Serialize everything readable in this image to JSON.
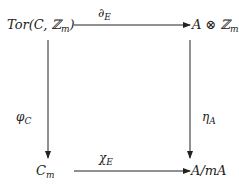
{
  "diagram": {
    "type": "commutative-square",
    "nodes": {
      "top_left": {
        "main": "Tor(C, ℤ",
        "sub": "m",
        "tail": ")"
      },
      "top_right": {
        "main": "A ⊗ ℤ",
        "sub": "m"
      },
      "bottom_left": {
        "main": "C",
        "sub": "m"
      },
      "bottom_right": {
        "main": "A/mA"
      }
    },
    "arrows": {
      "top": {
        "label": "∂",
        "sub": "E",
        "from": "top_left",
        "to": "top_right"
      },
      "left": {
        "label": "φ",
        "sub": "C",
        "from": "top_left",
        "to": "bottom_left"
      },
      "right": {
        "label": "η",
        "sub": "A",
        "from": "top_right",
        "to": "bottom_right"
      },
      "bottom": {
        "label": "χ",
        "sub": "E",
        "from": "bottom_left",
        "to": "bottom_right"
      }
    }
  }
}
